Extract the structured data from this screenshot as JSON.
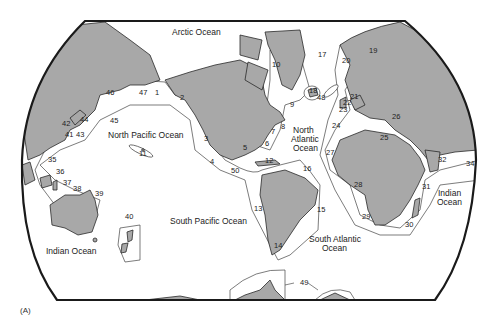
{
  "figure": {
    "caption": "(A)"
  },
  "oceans": [
    {
      "name": "Arctic Ocean",
      "x": 194,
      "y": 35
    },
    {
      "name": "North Pacific Ocean",
      "x": 108,
      "y": 138
    },
    {
      "name": "North Atlantic Ocean",
      "lines": [
        "North",
        "Atlantic",
        "Ocean"
      ],
      "x": 304,
      "y": 132
    },
    {
      "name": "South Pacific Ocean",
      "x": 170,
      "y": 224
    },
    {
      "name": "South Atlantic Ocean",
      "lines": [
        "South Atlantic",
        "Ocean"
      ],
      "x": 333,
      "y": 242
    },
    {
      "name": "Indian Ocean",
      "x": 46,
      "y": 254
    },
    {
      "name": "Indian Ocean",
      "lines": [
        "Indian",
        "Ocean"
      ],
      "x": 448,
      "y": 195
    }
  ],
  "regions": [
    {
      "id": "1",
      "x": 155,
      "y": 95
    },
    {
      "id": "2",
      "x": 180,
      "y": 100
    },
    {
      "id": "3",
      "x": 204,
      "y": 141
    },
    {
      "id": "4",
      "x": 210,
      "y": 164
    },
    {
      "id": "5",
      "x": 243,
      "y": 150
    },
    {
      "id": "6",
      "x": 265,
      "y": 146
    },
    {
      "id": "7",
      "x": 271,
      "y": 134
    },
    {
      "id": "8",
      "x": 281,
      "y": 129
    },
    {
      "id": "9",
      "x": 290,
      "y": 107
    },
    {
      "id": "10",
      "x": 272,
      "y": 67
    },
    {
      "id": "11",
      "x": 139,
      "y": 156
    },
    {
      "id": "12",
      "x": 265,
      "y": 163
    },
    {
      "id": "13",
      "x": 254,
      "y": 211
    },
    {
      "id": "14",
      "x": 274,
      "y": 248
    },
    {
      "id": "15",
      "x": 317,
      "y": 212
    },
    {
      "id": "16",
      "x": 303,
      "y": 171
    },
    {
      "id": "17",
      "x": 318,
      "y": 57
    },
    {
      "id": "18",
      "x": 309,
      "y": 93
    },
    {
      "id": "19",
      "x": 369,
      "y": 53
    },
    {
      "id": "20",
      "x": 342,
      "y": 63
    },
    {
      "id": "21",
      "x": 350,
      "y": 99
    },
    {
      "id": "22",
      "x": 343,
      "y": 105
    },
    {
      "id": "23",
      "x": 339,
      "y": 112
    },
    {
      "id": "24",
      "x": 332,
      "y": 128
    },
    {
      "id": "25",
      "x": 380,
      "y": 140
    },
    {
      "id": "26",
      "x": 392,
      "y": 119
    },
    {
      "id": "27",
      "x": 326,
      "y": 155
    },
    {
      "id": "28",
      "x": 354,
      "y": 187
    },
    {
      "id": "29",
      "x": 362,
      "y": 219
    },
    {
      "id": "30",
      "x": 405,
      "y": 227
    },
    {
      "id": "31",
      "x": 422,
      "y": 189
    },
    {
      "id": "32",
      "x": 438,
      "y": 162
    },
    {
      "id": "34",
      "x": 466,
      "y": 166
    },
    {
      "id": "35",
      "x": 48,
      "y": 162
    },
    {
      "id": "36",
      "x": 56,
      "y": 174
    },
    {
      "id": "37",
      "x": 63,
      "y": 185
    },
    {
      "id": "38",
      "x": 73,
      "y": 191
    },
    {
      "id": "39",
      "x": 95,
      "y": 196
    },
    {
      "id": "40",
      "x": 125,
      "y": 219
    },
    {
      "id": "41",
      "x": 65,
      "y": 137
    },
    {
      "id": "42",
      "x": 62,
      "y": 126
    },
    {
      "id": "43",
      "x": 76,
      "y": 137
    },
    {
      "id": "44",
      "x": 80,
      "y": 122
    },
    {
      "id": "45",
      "x": 110,
      "y": 123
    },
    {
      "id": "46",
      "x": 106,
      "y": 95
    },
    {
      "id": "47",
      "x": 139,
      "y": 95
    },
    {
      "id": "48",
      "x": 317,
      "y": 100
    },
    {
      "id": "49",
      "x": 300,
      "y": 285
    },
    {
      "id": "50",
      "x": 231,
      "y": 173
    }
  ]
}
